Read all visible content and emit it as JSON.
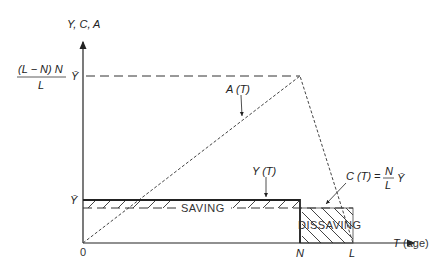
{
  "diagram": {
    "type": "life-cycle saving model",
    "axes": {
      "y_label": "Y, C, A",
      "x_label": "T",
      "x_label_suffix": "(age)",
      "origin_label": "0",
      "x_ticks": [
        "N",
        "L"
      ],
      "y_ticks": [
        {
          "label": "Ȳ",
          "level": "income"
        },
        {
          "label_num": "(L − N) N",
          "label_den": "L",
          "label_suffix": "Ȳ",
          "level": "peak assets"
        }
      ]
    },
    "curves": [
      {
        "name": "Y(T)",
        "label": "Y (T)",
        "style": "solid"
      },
      {
        "name": "C(T)",
        "label_lhs": "C (T) =",
        "label_num": "N",
        "label_den": "L",
        "label_suffix": "Ȳ",
        "style": "dashed"
      },
      {
        "name": "A(T)",
        "label": "A (T)",
        "style": "dotted-dashed"
      }
    ],
    "regions": [
      {
        "name": "saving",
        "label": "SAVING"
      },
      {
        "name": "dissaving",
        "label": "DISSAVING"
      }
    ]
  }
}
